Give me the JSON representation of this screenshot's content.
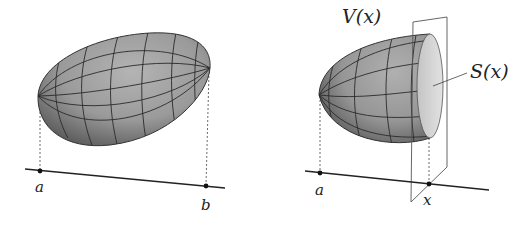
{
  "figures": [
    {
      "name": "solid",
      "labels": {
        "left_end": "a",
        "right_end": "b"
      }
    },
    {
      "name": "cross-section",
      "labels": {
        "left_end": "a",
        "cut_point": "x",
        "volume": "V(x)",
        "section": "S(x)"
      }
    }
  ],
  "colors": {
    "surface": "#9a9a9a",
    "surface_dark": "#6e6e6e",
    "grid": "#2a2a2a",
    "section_face": "#d6d6d6",
    "axis": "#222222",
    "plane": "#555555"
  }
}
